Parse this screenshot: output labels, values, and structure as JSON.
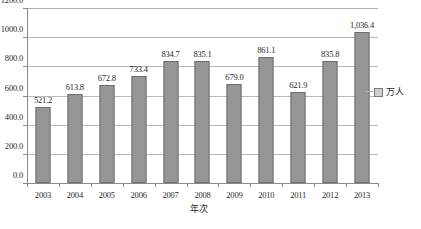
{
  "chart_data": {
    "type": "bar",
    "title": "",
    "xlabel": "年次",
    "ylabel": "",
    "categories": [
      "2003",
      "2004",
      "2005",
      "2006",
      "2007",
      "2008",
      "2009",
      "2010",
      "2011",
      "2012",
      "2013"
    ],
    "values": [
      521.2,
      613.8,
      672.8,
      733.4,
      834.7,
      835.1,
      679.0,
      861.1,
      621.9,
      835.8,
      1036.4
    ],
    "value_labels": [
      "521.2",
      "613.8",
      "672.8",
      "733.4",
      "834.7",
      "835.1",
      "679.0",
      "861.1",
      "621.9",
      "835.8",
      "1,036.4"
    ],
    "series": [
      {
        "name": "万人",
        "values": [
          521.2,
          613.8,
          672.8,
          733.4,
          834.7,
          835.1,
          679.0,
          861.1,
          621.9,
          835.8,
          1036.4
        ],
        "color": "#969696"
      }
    ],
    "ylim": [
      0,
      1200
    ],
    "y_ticks": [
      0,
      200,
      400,
      600,
      800,
      1000,
      1200
    ],
    "y_tick_labels": [
      "0.0",
      "200.0",
      "400.0",
      "600.0",
      "800.0",
      "1000.0",
      "1200.0"
    ],
    "grid": true,
    "legend_position": "right",
    "legend_entries": [
      "万人"
    ],
    "bar_color": "#969696",
    "bar_border_color": "#6d6d6d",
    "gridline_color": "#b8b8b8",
    "axis_color": "#8a8a8a"
  },
  "legend": {
    "items": [
      {
        "label": "万人",
        "swatch_color": "#cfcfcf"
      }
    ]
  },
  "axes": {
    "x_title": "年次"
  }
}
